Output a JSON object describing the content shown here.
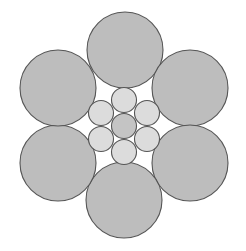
{
  "diagram": {
    "title": "",
    "colors": {
      "background": "#ffffff",
      "outer_strand_fill": "#bdbdbd",
      "core_wire_fill": "#dcdcdc",
      "center_wire_fill": "#c4c4c4",
      "stroke": "#555555"
    },
    "outer_strands": [
      {
        "id": "outer-top",
        "cx": 125,
        "cy": 50,
        "r": 38
      },
      {
        "id": "outer-upper-right",
        "cx": 190,
        "cy": 88,
        "r": 38
      },
      {
        "id": "outer-lower-right",
        "cx": 190,
        "cy": 163,
        "r": 38
      },
      {
        "id": "outer-bottom",
        "cx": 124,
        "cy": 200,
        "r": 38
      },
      {
        "id": "outer-lower-left",
        "cx": 58,
        "cy": 163,
        "r": 38
      },
      {
        "id": "outer-upper-left",
        "cx": 58,
        "cy": 88,
        "r": 38
      }
    ],
    "core_wires": [
      {
        "id": "core-top",
        "cx": 124,
        "cy": 100,
        "r": 12.5
      },
      {
        "id": "core-upper-right",
        "cx": 147,
        "cy": 113,
        "r": 12.5
      },
      {
        "id": "core-lower-right",
        "cx": 147,
        "cy": 139,
        "r": 12.5
      },
      {
        "id": "core-bottom",
        "cx": 124,
        "cy": 152,
        "r": 12.5
      },
      {
        "id": "core-lower-left",
        "cx": 101,
        "cy": 139,
        "r": 12.5
      },
      {
        "id": "core-upper-left",
        "cx": 101,
        "cy": 113,
        "r": 12.5
      }
    ],
    "center_wire": {
      "id": "core-center",
      "cx": 124,
      "cy": 126,
      "r": 12.5
    }
  }
}
